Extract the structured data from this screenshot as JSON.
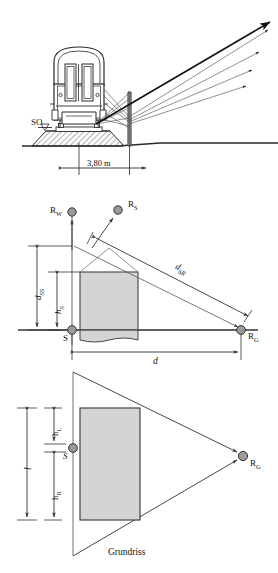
{
  "figure": {
    "title_caption": "Grundriss",
    "domain": "railway noise barrier reflection geometry"
  },
  "panel_top": {
    "name": "cross-section-ray-fan",
    "labels": {
      "rail_top": "SO",
      "distance_dimension": "3,80 m"
    },
    "elements": {
      "vehicle": "railway-car-cross-section",
      "barrier": "noise-barrier-wall",
      "ground": "ground-line",
      "ballast": "track-ballast",
      "rays": "reflected-sound-rays"
    },
    "ray_count": 4
  },
  "panel_middle": {
    "name": "elevation-section",
    "labels": {
      "source": "S",
      "receiver_wall": "R",
      "receiver_wall_sub": "W",
      "receiver_mirror": "R",
      "receiver_mirror_sub": "S",
      "receiver_ground": "R",
      "receiver_ground_sub": "G",
      "distance_source_receiver": "d",
      "distance_source_receiver_sub": "SR",
      "height_source_screen": "d",
      "height_source_screen_sub": "SS",
      "height_source": "h",
      "height_source_sub": "S",
      "horizontal_distance": "d"
    }
  },
  "panel_bottom": {
    "name": "plan-view",
    "caption": "Grundriss",
    "labels": {
      "source": "S",
      "receiver_ground": "R",
      "receiver_ground_sub": "G",
      "length_total": "l",
      "length_left": "h",
      "length_left_sub": "L",
      "length_right": "h",
      "length_right_sub": "R"
    }
  },
  "colors": {
    "line": "#1a1a1a",
    "thin_line": "#555555",
    "fill_grey": "#d4d4d4",
    "node_grey": "#9a9a9a",
    "ballast": "#8f8f8f",
    "background": "#ffffff"
  }
}
